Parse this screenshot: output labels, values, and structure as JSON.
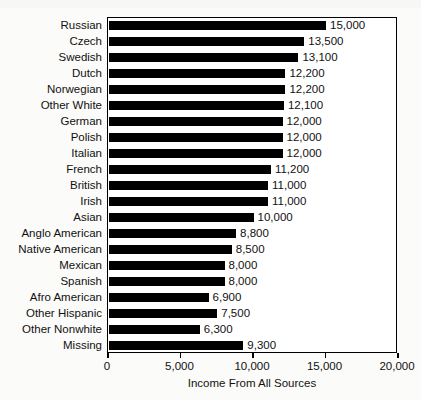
{
  "chart_data": {
    "type": "bar",
    "orientation": "horizontal",
    "title": "",
    "xlabel": "Income From All Sources",
    "ylabel": "",
    "xlim": [
      0,
      20000
    ],
    "xticks": [
      0,
      5000,
      10000,
      15000,
      20000
    ],
    "xtick_labels": [
      "0",
      "5,000",
      "10,000",
      "15,000",
      "20,000"
    ],
    "grid": false,
    "legend": null,
    "bar_color": "#000000",
    "categories": [
      "Russian",
      "Czech",
      "Swedish",
      "Dutch",
      "Norwegian",
      "Other White",
      "German",
      "Polish",
      "Italian",
      "French",
      "British",
      "Irish",
      "Asian",
      "Anglo American",
      "Native American",
      "Mexican",
      "Spanish",
      "Afro American",
      "Other Hispanic",
      "Other Nonwhite",
      "Missing"
    ],
    "values": [
      15000,
      13500,
      13100,
      12200,
      12200,
      12100,
      12000,
      12000,
      12000,
      11200,
      11000,
      11000,
      10000,
      8800,
      8500,
      8000,
      8000,
      6900,
      7500,
      6300,
      9300
    ],
    "value_labels": [
      "15,000",
      "13,500",
      "13,100",
      "12,200",
      "12,200",
      "12,100",
      "12,000",
      "12,000",
      "12,000",
      "11,200",
      "11,000",
      "11,000",
      "10,000",
      "8,800",
      "8,500",
      "8,000",
      "8,000",
      "6,900",
      "7,500",
      "6,300",
      "9,300"
    ]
  }
}
